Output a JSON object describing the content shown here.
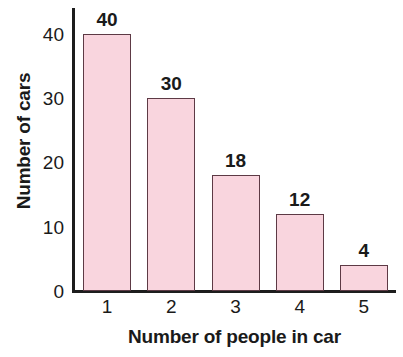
{
  "chart_data": {
    "type": "bar",
    "title": "",
    "xlabel": "Number of people in car",
    "ylabel": "Number of cars",
    "categories": [
      "1",
      "2",
      "3",
      "4",
      "5"
    ],
    "values": [
      40,
      30,
      18,
      12,
      4
    ],
    "value_labels": [
      "40",
      "30",
      "18",
      "12",
      "4"
    ],
    "ylim": [
      0,
      44
    ],
    "yticks": [
      0,
      10,
      20,
      30,
      40
    ],
    "ytick_labels": [
      "0",
      "10",
      "20",
      "30",
      "40"
    ],
    "grid": false,
    "legend": null,
    "bar_fill_color": "#f9d5de",
    "bar_border_color": "#5d3a45",
    "axis_color": "#1d1d1d",
    "background_color": "#ffffff"
  },
  "axes": {
    "y_title": "Number of cars",
    "x_title": "Number of people in car"
  }
}
